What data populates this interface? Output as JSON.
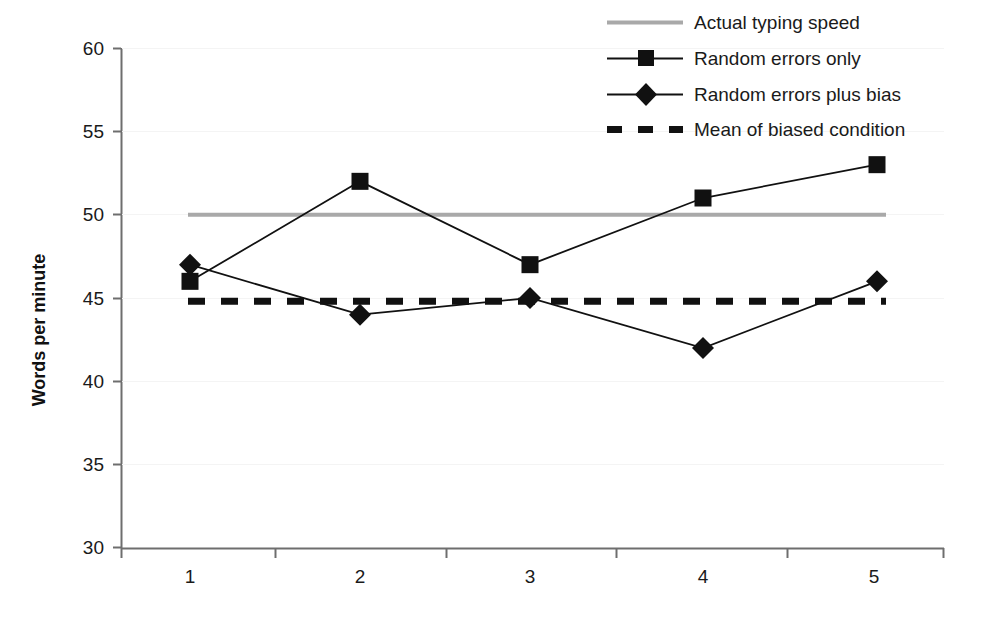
{
  "chart_data": {
    "type": "line",
    "title": "",
    "subtitle": "",
    "xlabel": "",
    "ylabel": "Words per minute",
    "categories": [
      "1",
      "2",
      "3",
      "4",
      "5"
    ],
    "xlim": [
      0.5,
      5.5
    ],
    "ylim": [
      30,
      60
    ],
    "ytick_labels": [
      "30",
      "35",
      "40",
      "45",
      "50",
      "55",
      "60"
    ],
    "ytick_values": [
      30,
      35,
      40,
      45,
      50,
      55,
      60
    ],
    "grid": false,
    "legend_position": "top-right",
    "series": [
      {
        "name": "Actual typing speed",
        "type": "reference-line",
        "marker": "none",
        "line_style": "solid",
        "color": "#a9a9a9",
        "constant_value": 50,
        "values": [
          50,
          50,
          50,
          50,
          50
        ]
      },
      {
        "name": "Random errors only",
        "type": "line",
        "marker": "square",
        "line_style": "solid",
        "color": "#111111",
        "values": [
          46,
          52,
          47,
          51,
          53
        ]
      },
      {
        "name": "Random errors plus bias",
        "type": "line",
        "marker": "diamond",
        "line_style": "solid",
        "color": "#111111",
        "values": [
          47,
          44,
          45,
          42,
          46
        ]
      },
      {
        "name": "Mean of biased condition",
        "type": "reference-line",
        "marker": "none",
        "line_style": "dashed",
        "color": "#111111",
        "constant_value": 44.8,
        "values": [
          44.8,
          44.8,
          44.8,
          44.8,
          44.8
        ]
      }
    ]
  },
  "legend": {
    "entries": [
      {
        "label": "Actual typing speed"
      },
      {
        "label": "Random errors only"
      },
      {
        "label": "Random errors plus bias"
      },
      {
        "label": "Mean of biased condition"
      }
    ]
  },
  "axes": {
    "y_title": "Words per minute",
    "y_ticks": [
      "60",
      "55",
      "50",
      "45",
      "40",
      "35",
      "30"
    ],
    "x_ticks": [
      "1",
      "2",
      "3",
      "4",
      "5"
    ]
  },
  "colors": {
    "axis": "#6e6e6e",
    "series_dark": "#111111",
    "reference_gray": "#a9a9a9",
    "background": "#ffffff"
  }
}
